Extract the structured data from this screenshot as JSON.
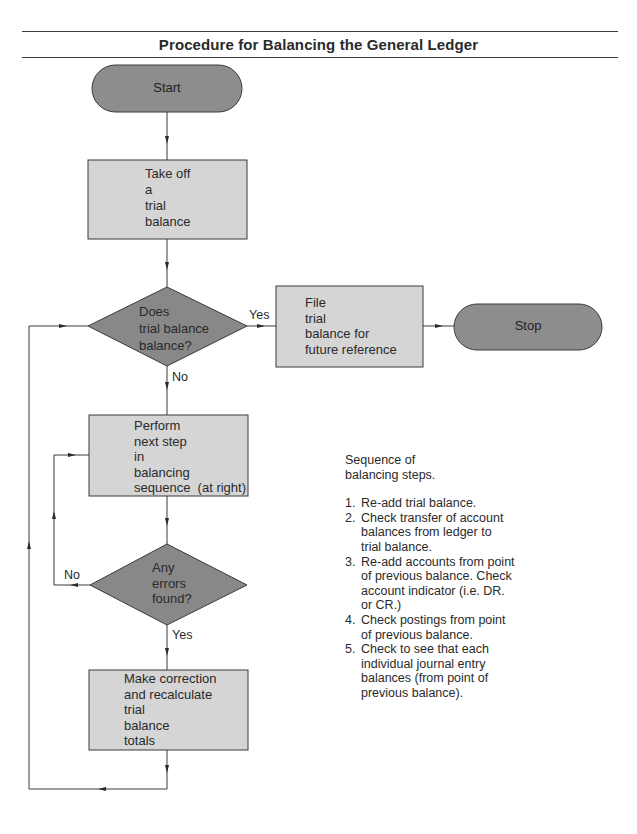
{
  "title": "Procedure for Balancing the General Ledger",
  "colors": {
    "terminal_fill": "#8d8d8d",
    "decision_fill": "#888888",
    "process_fill": "#d5d5d5",
    "stroke": "#3a3a3a"
  },
  "nodes": {
    "start": {
      "type": "terminal",
      "label": "Start"
    },
    "take_off": {
      "type": "process",
      "lines": [
        "Take off",
        "a",
        "trial",
        "balance"
      ]
    },
    "decision_balance": {
      "type": "decision",
      "lines": [
        "Does",
        "trial balance",
        "balance?"
      ]
    },
    "file": {
      "type": "process",
      "lines": [
        "File",
        "trial",
        "balance for",
        "future reference"
      ]
    },
    "stop": {
      "type": "terminal",
      "label": "Stop"
    },
    "perform": {
      "type": "process",
      "lines": [
        "Perform",
        "next step",
        "in",
        "balancing",
        "sequence  (at right)"
      ]
    },
    "decision_errors": {
      "type": "decision",
      "lines": [
        "Any",
        "errors",
        "found?"
      ]
    },
    "correction": {
      "type": "process",
      "lines": [
        "Make correction",
        "and recalculate",
        "trial",
        "balance",
        "totals"
      ]
    }
  },
  "edges": {
    "balance_yes": "Yes",
    "balance_no": "No",
    "errors_no": "No",
    "errors_yes": "Yes"
  },
  "notes": {
    "heading_line1": "Sequence of",
    "heading_line2": "balancing steps.",
    "steps": [
      {
        "num": "1.",
        "lines": [
          "Re-add trial balance."
        ]
      },
      {
        "num": "2.",
        "lines": [
          "Check transfer of account",
          "balances from ledger to",
          "trial balance."
        ]
      },
      {
        "num": "3.",
        "lines": [
          "Re-add accounts from point",
          "of previous balance. Check",
          "account indicator (i.e. DR.",
          "or CR.)"
        ]
      },
      {
        "num": "4.",
        "lines": [
          "Check postings from point",
          "of previous balance."
        ]
      },
      {
        "num": "5.",
        "lines": [
          "Check to see that each",
          "individual journal entry",
          "balances (from point of",
          "previous balance)."
        ]
      }
    ]
  }
}
